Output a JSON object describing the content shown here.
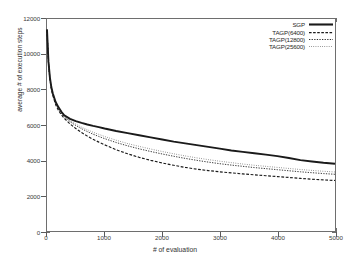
{
  "chart_data": {
    "type": "line",
    "title": "",
    "xlabel": "# of evaluation",
    "ylabel": "average # of execution steps",
    "xlim": [
      0,
      5000
    ],
    "ylim": [
      0,
      12000
    ],
    "xticks": [
      0,
      1000,
      2000,
      3000,
      4000,
      5000
    ],
    "yticks": [
      0,
      2000,
      4000,
      6000,
      8000,
      10000,
      12000
    ],
    "grid": false,
    "legend_position": "top-right",
    "x": [
      0,
      25,
      50,
      75,
      100,
      150,
      200,
      250,
      300,
      400,
      500,
      600,
      700,
      800,
      900,
      1000,
      1200,
      1400,
      1600,
      1800,
      2000,
      2200,
      2400,
      2600,
      2800,
      3000,
      3200,
      3400,
      3600,
      3800,
      4000,
      4200,
      4400,
      4600,
      4800,
      5000
    ],
    "series": [
      {
        "name": "SGP",
        "style": "solid-thick",
        "values": [
          11400,
          9600,
          8700,
          8150,
          7800,
          7300,
          7000,
          6750,
          6550,
          6350,
          6220,
          6120,
          6030,
          5950,
          5880,
          5800,
          5660,
          5540,
          5420,
          5300,
          5180,
          5060,
          4960,
          4860,
          4760,
          4660,
          4560,
          4480,
          4400,
          4320,
          4240,
          4130,
          4010,
          3930,
          3860,
          3810
        ]
      },
      {
        "name": "TAGP(6400)",
        "style": "dashed",
        "values": [
          11400,
          9550,
          8600,
          8050,
          7680,
          7150,
          6820,
          6580,
          6380,
          6060,
          5800,
          5570,
          5370,
          5190,
          5030,
          4880,
          4600,
          4370,
          4170,
          4000,
          3850,
          3720,
          3600,
          3500,
          3420,
          3350,
          3290,
          3230,
          3180,
          3130,
          3080,
          3030,
          2980,
          2930,
          2890,
          2860
        ]
      },
      {
        "name": "TAGP(12800)",
        "style": "dotted",
        "values": [
          11400,
          9580,
          8650,
          8100,
          7740,
          7220,
          6900,
          6660,
          6470,
          6190,
          5970,
          5790,
          5630,
          5480,
          5350,
          5230,
          5010,
          4820,
          4650,
          4500,
          4360,
          4230,
          4110,
          4000,
          3900,
          3810,
          3730,
          3660,
          3590,
          3530,
          3470,
          3410,
          3350,
          3300,
          3250,
          3210
        ]
      },
      {
        "name": "TAGP(25600)",
        "style": "fine-dotted",
        "values": [
          11400,
          9600,
          8680,
          8130,
          7770,
          7260,
          6950,
          6710,
          6520,
          6250,
          6050,
          5880,
          5730,
          5590,
          5470,
          5350,
          5140,
          4950,
          4790,
          4640,
          4500,
          4370,
          4250,
          4140,
          4040,
          3950,
          3870,
          3790,
          3720,
          3660,
          3600,
          3540,
          3480,
          3430,
          3380,
          3340
        ]
      }
    ]
  },
  "legend": {
    "entries": [
      {
        "label": "SGP"
      },
      {
        "label": "TAGP(6400)"
      },
      {
        "label": "TAGP(12800)"
      },
      {
        "label": "TAGP(25600)"
      }
    ]
  },
  "colors": {
    "line": "#1a1a1a",
    "frame": "#6e6e6e",
    "text": "#2a2a2a",
    "background": "#ffffff"
  }
}
